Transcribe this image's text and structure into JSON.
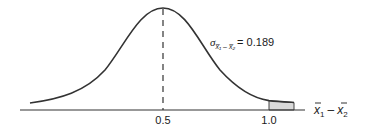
{
  "diagram": {
    "type": "normal-distribution-curve",
    "mean_label": "0.5",
    "tail_label": "1.0",
    "axis_label": {
      "var1": "x",
      "sub1": "1",
      "minus": "–",
      "var2": "x",
      "sub2": "2"
    },
    "sigma_annotation": {
      "symbol": "σ",
      "sub": "x̅₁ – x̅₂",
      "equals_value": "= 0.189"
    },
    "mean": 0.5,
    "std_error": 0.189,
    "shaded_region": "right tail beyond 1.0",
    "colors": {
      "curve": "#333333",
      "axis": "#333333",
      "shade": "#d9d9d9"
    }
  }
}
